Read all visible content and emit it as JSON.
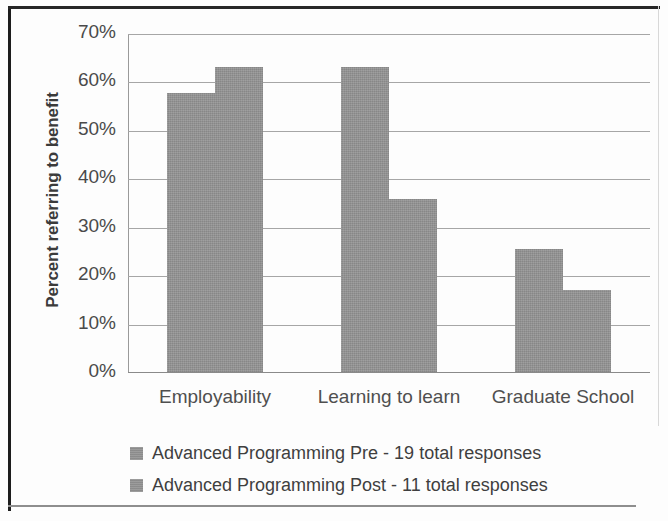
{
  "chart_data": {
    "type": "bar",
    "title": "",
    "xlabel": "",
    "ylabel": "Percent referring to benefit",
    "categories": [
      "Employability",
      "Learning to learn",
      "Graduate School"
    ],
    "series": [
      {
        "name": "Advanced Programming Pre  - 19 total responses",
        "values": [
          57.9,
          63.2,
          25.6
        ],
        "color": "#949494"
      },
      {
        "name": "Advanced Programming Post  - 11 total responses",
        "values": [
          63.2,
          36.0,
          17.2
        ],
        "color": "#949494"
      }
    ],
    "ylim": [
      0,
      70
    ],
    "ytick_values": [
      0,
      10,
      20,
      30,
      40,
      50,
      60,
      70
    ],
    "ytick_labels": [
      "0%",
      "10%",
      "20%",
      "30%",
      "40%",
      "50%",
      "60%",
      "70%"
    ],
    "grid": true,
    "grid_axis": "y",
    "legend_position": "bottom-left",
    "value_format": "percent"
  },
  "axis": {
    "y_title": "Percent referring to benefit"
  },
  "legend": {
    "entries": [
      {
        "label": "Advanced Programming Pre  - 19 total responses",
        "swatch": "#949494"
      },
      {
        "label": "Advanced Programming Post  - 11 total responses",
        "swatch": "#949494"
      }
    ]
  }
}
